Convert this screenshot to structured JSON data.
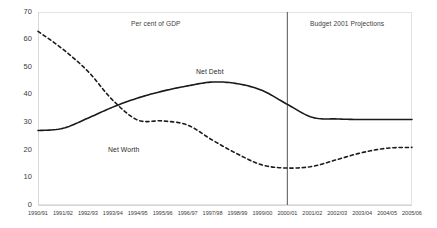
{
  "chart_data": {
    "type": "line",
    "title": "Per cent of GDP",
    "xlabel": "",
    "ylabel": "",
    "ylim": [
      0,
      70
    ],
    "ytick_step": 10,
    "yticks": [
      "0",
      "10",
      "20",
      "30",
      "40",
      "50",
      "60",
      "70"
    ],
    "grid": false,
    "legend_position": "inline-labels",
    "categories": [
      "1990/91",
      "1991/92",
      "1992/93",
      "1993/94",
      "1994/95",
      "1995/96",
      "1996/97",
      "1997/98",
      "1998/99",
      "1999/00",
      "2000/01",
      "2001/02",
      "2002/03",
      "2003/04",
      "2004/05",
      "2005/06"
    ],
    "series": [
      {
        "name": "Net Debt",
        "style": "solid",
        "color": "#1a1a1a",
        "values": [
          27.0,
          27.8,
          31.5,
          35.5,
          38.8,
          41.3,
          43.2,
          44.6,
          44.0,
          41.5,
          36.5,
          31.8,
          31.2,
          31.0,
          31.0,
          31.0
        ]
      },
      {
        "name": "Net Worth",
        "style": "dashed",
        "color": "#1a1a1a",
        "values": [
          63.0,
          56.5,
          48.5,
          38.0,
          30.8,
          30.5,
          29.0,
          23.5,
          18.5,
          14.5,
          13.4,
          14.0,
          16.5,
          19.0,
          20.6,
          20.9
        ]
      }
    ],
    "annotations": [
      {
        "name": "chart-subtitle",
        "text": "Per cent of GDP"
      },
      {
        "name": "projection-note",
        "text": "Budget 2001 Projections"
      },
      {
        "name": "net-debt-label",
        "text": "Net Debt"
      },
      {
        "name": "net-worth-label",
        "text": "Net Worth"
      }
    ],
    "divider": {
      "name": "projection-divider",
      "at_category": "2000/01",
      "color": "#555555"
    }
  }
}
